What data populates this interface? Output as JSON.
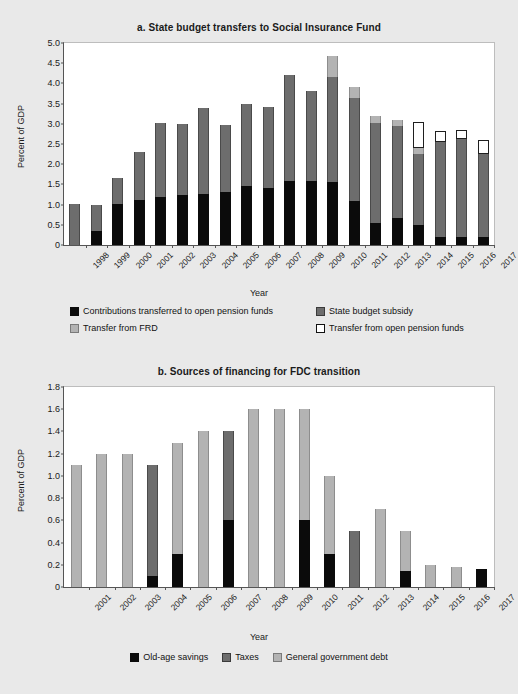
{
  "chart_data": [
    {
      "id": "a",
      "type": "bar",
      "stacked": true,
      "title": "a. State budget transfers to Social Insurance Fund",
      "xlabel": "Year",
      "ylabel": "Percent of GDP",
      "ylim": [
        0,
        5.0
      ],
      "yticks": [
        "0",
        "0.5",
        "1.0",
        "1.5",
        "2.0",
        "2.5",
        "3.0",
        "3.5",
        "4.0",
        "4.5",
        "5.0"
      ],
      "ytick_values": [
        0,
        0.5,
        1.0,
        1.5,
        2.0,
        2.5,
        3.0,
        3.5,
        4.0,
        4.5,
        5.0
      ],
      "grid": false,
      "legend_position": "below",
      "categories": [
        "1998",
        "1999",
        "2000",
        "2001",
        "2002",
        "2003",
        "2004",
        "2005",
        "2006",
        "2007",
        "2008",
        "2009",
        "2010",
        "2011",
        "2012",
        "2013",
        "2014",
        "2015",
        "2016",
        "2017"
      ],
      "series": [
        {
          "name": "Contributions transferred to open pension funds",
          "color": "#0b0b0b",
          "style": "black",
          "values": [
            0.0,
            0.35,
            1.02,
            1.12,
            1.2,
            1.24,
            1.27,
            1.3,
            1.47,
            1.4,
            1.59,
            1.58,
            1.56,
            1.08,
            0.54,
            0.67,
            0.5,
            0.2,
            0.2,
            0.19
          ]
        },
        {
          "name": "State budget subsidy",
          "color": "#6d6d6d",
          "style": "dark",
          "values": [
            1.02,
            0.64,
            0.65,
            1.18,
            1.81,
            1.76,
            2.12,
            1.68,
            2.02,
            2.01,
            2.61,
            2.23,
            2.6,
            2.57,
            2.48,
            2.28,
            1.76,
            2.35,
            2.43,
            2.07
          ]
        },
        {
          "name": "Transfer from FRD",
          "color": "#b3b3b3",
          "style": "light",
          "values": [
            0.0,
            0.0,
            0.0,
            0.0,
            0.0,
            0.0,
            0.0,
            0.0,
            0.0,
            0.0,
            0.0,
            0.0,
            0.52,
            0.27,
            0.17,
            0.15,
            0.15,
            0.0,
            0.0,
            0.0
          ]
        },
        {
          "name": "Transfer from open pension funds",
          "color": "#ffffff",
          "style": "white",
          "values": [
            0.0,
            0.0,
            0.0,
            0.0,
            0.0,
            0.0,
            0.0,
            0.0,
            0.0,
            0.0,
            0.0,
            0.0,
            0.0,
            0.0,
            0.0,
            0.0,
            0.64,
            0.27,
            0.22,
            0.35
          ]
        }
      ],
      "totals": [
        1.02,
        0.99,
        1.67,
        2.3,
        3.01,
        3.0,
        3.39,
        2.98,
        3.49,
        3.41,
        4.2,
        3.81,
        4.68,
        3.92,
        3.19,
        3.1,
        3.05,
        2.82,
        2.85,
        2.61
      ]
    },
    {
      "id": "b",
      "type": "bar",
      "stacked": true,
      "title": "b. Sources of financing for FDC transition",
      "xlabel": "Year",
      "ylabel": "Percent of GDP",
      "ylim": [
        0,
        1.8
      ],
      "yticks": [
        "0",
        "0.2",
        "0.4",
        "0.6",
        "0.8",
        "1.0",
        "1.2",
        "1.4",
        "1.6",
        "1.8"
      ],
      "ytick_values": [
        0,
        0.2,
        0.4,
        0.6,
        0.8,
        1.0,
        1.2,
        1.4,
        1.6,
        1.8
      ],
      "grid": false,
      "legend_position": "below",
      "categories": [
        "2001",
        "2002",
        "2003",
        "2004",
        "2005",
        "2006",
        "2007",
        "2008",
        "2009",
        "2010",
        "2011",
        "2012",
        "2013",
        "2014",
        "2015",
        "2016",
        "2017"
      ],
      "series": [
        {
          "name": "Old-age savings",
          "color": "#0b0b0b",
          "style": "black",
          "values": [
            0.0,
            0.0,
            0.0,
            0.1,
            0.3,
            0.0,
            0.6,
            0.0,
            0.0,
            0.6,
            0.3,
            0.0,
            0.0,
            0.14,
            0.0,
            0.0,
            0.16
          ]
        },
        {
          "name": "Taxes",
          "color": "#6d6d6d",
          "style": "dark",
          "values": [
            0.0,
            0.0,
            0.0,
            1.0,
            0.0,
            0.0,
            0.8,
            0.0,
            0.0,
            0.0,
            0.0,
            0.5,
            0.0,
            0.0,
            0.0,
            0.0,
            0.0
          ]
        },
        {
          "name": "General government debt",
          "color": "#b3b3b3",
          "style": "light",
          "values": [
            1.1,
            1.2,
            1.2,
            0.0,
            1.0,
            1.4,
            0.0,
            1.6,
            1.6,
            1.0,
            0.7,
            0.0,
            0.7,
            0.36,
            0.2,
            0.18,
            0.0
          ]
        }
      ],
      "totals": [
        1.1,
        1.2,
        1.2,
        1.1,
        1.3,
        1.4,
        1.4,
        1.6,
        1.6,
        1.6,
        1.0,
        0.5,
        0.7,
        0.5,
        0.2,
        0.18,
        0.16
      ]
    }
  ]
}
